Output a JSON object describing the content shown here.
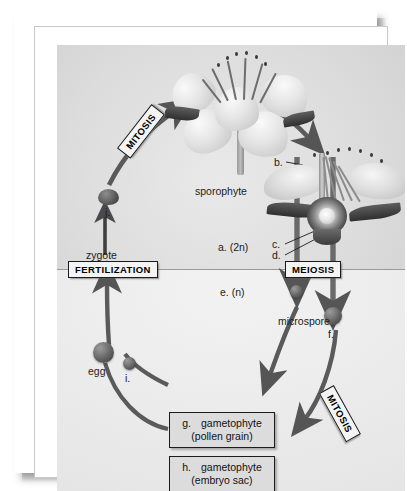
{
  "figure": {
    "ploidy_divider": true
  },
  "stage_labels": [
    {
      "id": "mitosis-upper",
      "text": "MITOSIS"
    },
    {
      "id": "fertilization",
      "text": "FERTILIZATION"
    },
    {
      "id": "meiosis",
      "text": "MEIOSIS"
    },
    {
      "id": "mitosis-lower",
      "text": "MITOSIS"
    }
  ],
  "ploidy": {
    "diploid": "a.  (2n)",
    "haploid": "e.  (n)"
  },
  "structure_labels": [
    {
      "id": "sporophyte",
      "text": "sporophyte"
    },
    {
      "id": "zygote",
      "text": "zygote"
    },
    {
      "id": "microspore",
      "text": "microspore"
    },
    {
      "id": "egg",
      "text": "egg"
    }
  ],
  "blank_markers": [
    {
      "id": "marker-b",
      "text": "b."
    },
    {
      "id": "marker-c",
      "text": "c."
    },
    {
      "id": "marker-d",
      "text": "d."
    },
    {
      "id": "marker-f",
      "text": "f."
    },
    {
      "id": "marker-i",
      "text": "i."
    },
    {
      "id": "marker-j",
      "text": "j."
    }
  ],
  "product_boxes": [
    {
      "id": "pollen-grain-box",
      "code": "g.",
      "name": "gametophyte",
      "detail": "(pollen grain)"
    },
    {
      "id": "embryo-sac-box",
      "code": "h.",
      "name": "gametophyte",
      "detail": "(embryo sac)"
    }
  ],
  "colors": {
    "ink": "#1b1b1b",
    "arrow": "#4a4a4a",
    "panel_diploid": "#d6d6d6",
    "panel_haploid": "#ececec",
    "box_fill": "#dcdcdc",
    "stage_fill": "#f4f4f4"
  }
}
